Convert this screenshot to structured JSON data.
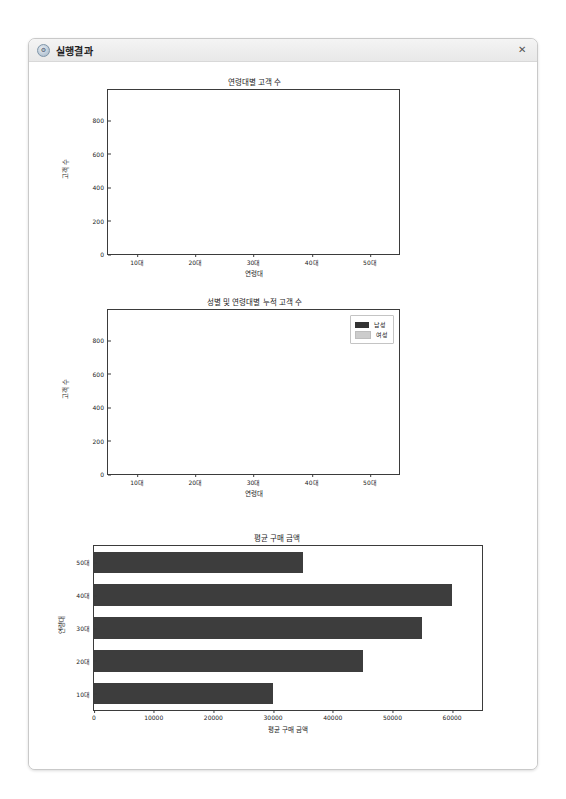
{
  "window": {
    "title": "실행결과",
    "icon": "python-logo-icon",
    "close_label": "✕"
  },
  "chart_data": [
    {
      "type": "bar",
      "title": "연령대별 고객 수",
      "xlabel": "연령대",
      "ylabel": "고객 수",
      "categories": [
        "10대",
        "20대",
        "30대",
        "40대",
        "50대"
      ],
      "values": [
        550,
        750,
        940,
        500,
        350
      ],
      "yticks": [
        0,
        200,
        400,
        600,
        800
      ],
      "ylim": [
        0,
        980
      ],
      "grid": false,
      "legend": null,
      "bar_color": "#a9a9a9"
    },
    {
      "type": "bar",
      "title": "성별 및 연령대별 누적 고객 수",
      "xlabel": "연령대",
      "ylabel": "고객 수",
      "categories": [
        "10대",
        "20대",
        "30대",
        "40대",
        "50대"
      ],
      "series": [
        {
          "name": "남성",
          "values": [
            300,
            400,
            500,
            200,
            150
          ],
          "color": "#333333"
        },
        {
          "name": "여성",
          "values": [
            250,
            350,
            440,
            300,
            200
          ],
          "color": "#cccccc"
        }
      ],
      "yticks": [
        0,
        200,
        400,
        600,
        800
      ],
      "ylim": [
        0,
        980
      ],
      "grid": false,
      "legend_position": "upper right",
      "stacked": true
    },
    {
      "type": "bar",
      "orientation": "horizontal",
      "title": "평균 구매 금액",
      "xlabel": "평균 구매 금액",
      "ylabel": "연령대",
      "categories": [
        "10대",
        "20대",
        "30대",
        "40대",
        "50대"
      ],
      "values": [
        30000,
        45000,
        55000,
        60000,
        35000
      ],
      "xticks": [
        0,
        10000,
        20000,
        30000,
        40000,
        50000,
        60000
      ],
      "xlim": [
        0,
        65000
      ],
      "grid": false,
      "legend": null,
      "bar_color": "#3d3d3d"
    }
  ]
}
